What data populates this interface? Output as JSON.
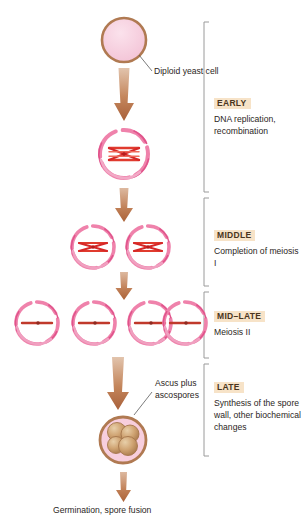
{
  "figure": {
    "colors": {
      "cell_ring_brown": "#b07a52",
      "cell_fill_pink": "#f7cedd",
      "nucleus_ring_pink": "#e24d87",
      "chromosome_red": "#d62828",
      "arrow_brown": "#b5714a",
      "bracket_gray": "#9a9a9a",
      "label_highlight": "#f7e3c8",
      "spore_tan": "#c79a6b",
      "leader_gray": "#5a5a5a"
    }
  },
  "callouts": {
    "diploid": "Diploid yeast cell",
    "ascus_line1": "Ascus plus",
    "ascus_line2": "ascospores"
  },
  "caption": "Germination, spore fusion",
  "stages": [
    {
      "name": "EARLY",
      "desc": "DNA replication, recombination"
    },
    {
      "name": "MIDDLE",
      "desc": "Completion of meiosis I"
    },
    {
      "name": "MID–LATE",
      "desc": "Meiosis II"
    },
    {
      "name": "LATE",
      "desc": "Synthesis of the spore wall, other biochemical changes"
    }
  ],
  "cell_rows": [
    {
      "stage_label": "diploid-yeast-cell",
      "count": 1,
      "content": "none"
    },
    {
      "stage_label": "recombination-cell",
      "count": 1,
      "content": "crossover-chromosomes"
    },
    {
      "stage_label": "meiosis-one-cells",
      "count": 2,
      "content": "x-chromosome"
    },
    {
      "stage_label": "meiosis-two-cells",
      "count": 4,
      "content": "single-chromosome"
    },
    {
      "stage_label": "ascus-with-spores",
      "count": 1,
      "content": "four-ascospores"
    }
  ]
}
